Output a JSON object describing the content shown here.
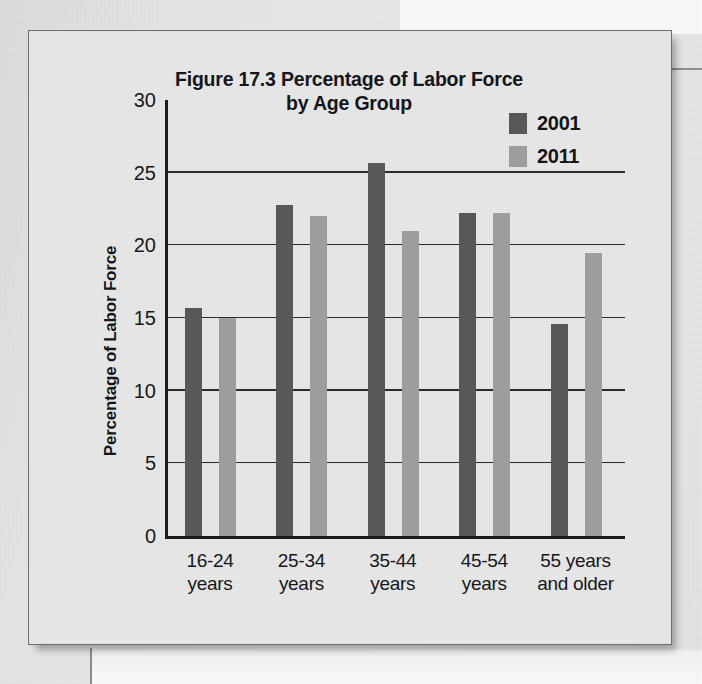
{
  "figure": {
    "title_lines": [
      "Figure 17.3 Percentage of Labor Force",
      "by Age Group"
    ],
    "title_full": "Figure 17.3 Percentage of Labor Force by Age Group"
  },
  "colors": {
    "series_2001": "#585858",
    "series_2011": "#9d9d9d",
    "axis": "#1c1c1c",
    "grid": "#2b2b2b",
    "text": "#16171b",
    "figure_bg": "#e8e8e8",
    "page_bg": "#e6e6e6"
  },
  "chart_data": {
    "type": "bar",
    "title": "Figure 17.3 Percentage of Labor Force by Age Group",
    "xlabel": "",
    "ylabel": "Percentage of Labor Force",
    "categories": [
      "16-24 years",
      "25-34 years",
      "35-44 years",
      "45-54 years",
      "55 years and older"
    ],
    "category_lines": [
      [
        "16-24",
        "years"
      ],
      [
        "25-34",
        "years"
      ],
      [
        "35-44",
        "years"
      ],
      [
        "45-54",
        "years"
      ],
      [
        "55 years",
        "and older"
      ]
    ],
    "series": [
      {
        "name": "2001",
        "color": "#585858",
        "values": [
          15.7,
          22.8,
          25.7,
          22.2,
          14.6
        ]
      },
      {
        "name": "2011",
        "color": "#9d9d9d",
        "values": [
          15.0,
          22.0,
          21.0,
          22.2,
          19.5
        ]
      }
    ],
    "ylim": [
      0,
      30
    ],
    "yticks": [
      0,
      5,
      10,
      15,
      20,
      25,
      30
    ],
    "ytick_labels": [
      "0",
      "5",
      "10",
      "15",
      "20",
      "25",
      "30"
    ],
    "gridlines_at": [
      5,
      10,
      15,
      20,
      25
    ],
    "grid": true,
    "legend_position": "top-right"
  }
}
